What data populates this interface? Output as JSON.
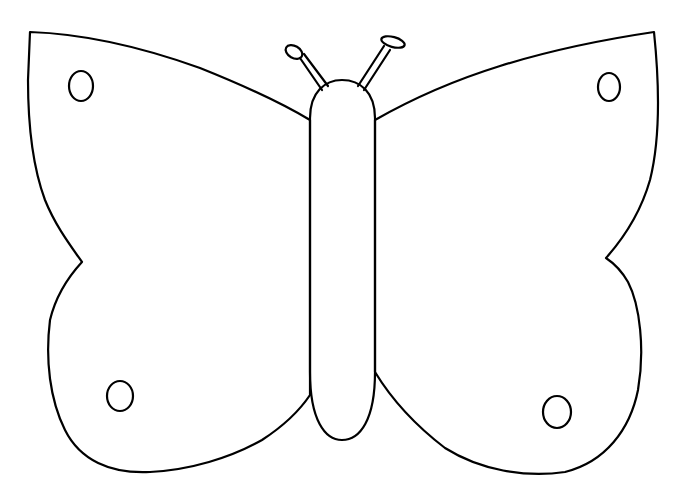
{
  "image": {
    "subject": "butterfly outline coloring page",
    "background_color": "#ffffff",
    "line_color": "#000000",
    "parts": [
      "left-forewing",
      "right-forewing",
      "left-hindwing",
      "right-hindwing",
      "body",
      "left-antenna",
      "right-antenna",
      "wing-spots"
    ],
    "spot_count": 4
  }
}
